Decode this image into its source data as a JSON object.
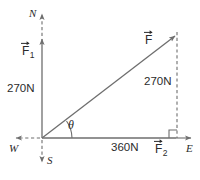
{
  "figure": {
    "type": "vector-diagram",
    "background_color": "#ffffff",
    "stroke_color": "#6e6e6e",
    "text_color": "#2b2b2b",
    "compass": {
      "north": "N",
      "south": "S",
      "east": "E",
      "west": "W"
    },
    "vectors": [
      {
        "id": "f1",
        "symbol": "F",
        "subscript": "1",
        "magnitude": "270N",
        "direction": "north"
      },
      {
        "id": "f2",
        "symbol": "F",
        "subscript": "2",
        "magnitude": "360N",
        "direction": "east"
      },
      {
        "id": "f",
        "symbol": "F",
        "subscript": "",
        "magnitude": "270N",
        "direction": "resultant"
      }
    ],
    "angle_label": "θ",
    "right_angle_marker": true,
    "labels": {
      "f1_symbol": "F",
      "f1_sub": "1",
      "f1_magnitude": "270N",
      "f2_symbol": "F",
      "f2_sub": "2",
      "f2_magnitude": "360N",
      "resultant_symbol": "F",
      "resultant_magnitude": "270N",
      "theta": "θ",
      "north": "N",
      "south": "S",
      "east": "E",
      "west": "W"
    }
  }
}
